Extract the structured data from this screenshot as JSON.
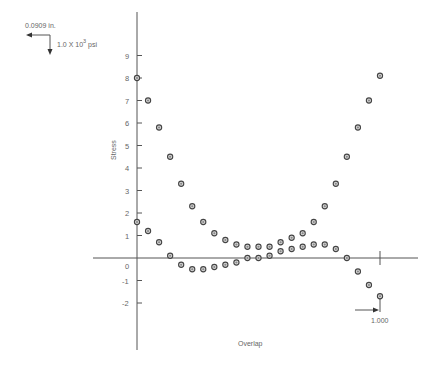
{
  "chart_data": {
    "type": "scatter",
    "title": "",
    "xlabel": "Overlap",
    "ylabel": "Stress",
    "y_tick_labels": [
      "9",
      "8",
      "7",
      "6",
      "5",
      "4",
      "3",
      "2",
      "1",
      "0",
      "-1",
      "-2"
    ],
    "y_ticks": [
      9,
      8,
      7,
      6,
      5,
      4,
      3,
      2,
      1,
      0,
      -1,
      -2
    ],
    "x_marker_label": "1.000",
    "x_marker_value": 1.0,
    "ylim": [
      -4.2,
      10.4
    ],
    "xlim": [
      -0.2,
      1.17
    ],
    "grid": false,
    "legend": null,
    "scale_indicator": {
      "horizontal_label": "0.0909 in.",
      "vertical_label_base": "1.0 X 10",
      "vertical_label_exp": "3",
      "vertical_label_unit": " psi"
    },
    "series": [
      {
        "name": "upper-curve",
        "x": [
          0.0,
          0.0455,
          0.0909,
          0.1364,
          0.1818,
          0.2273,
          0.2727,
          0.3182,
          0.3636,
          0.4091,
          0.4545,
          0.5,
          0.5455,
          0.5909,
          0.6364,
          0.6818,
          0.7273,
          0.7727,
          0.8182,
          0.8636,
          0.9091,
          0.9545,
          1.0
        ],
        "y": [
          8.0,
          7.0,
          5.8,
          4.5,
          3.3,
          2.3,
          1.6,
          1.1,
          0.8,
          0.6,
          0.5,
          0.5,
          0.5,
          0.7,
          0.9,
          1.1,
          1.6,
          2.3,
          3.3,
          4.5,
          5.8,
          7.0,
          8.1
        ]
      },
      {
        "name": "lower-curve",
        "x": [
          0.0,
          0.0455,
          0.0909,
          0.1364,
          0.1818,
          0.2273,
          0.2727,
          0.3182,
          0.3636,
          0.4091,
          0.4545,
          0.5,
          0.5455,
          0.5909,
          0.6364,
          0.6818,
          0.7273,
          0.7727,
          0.8182,
          0.8636,
          0.9091,
          0.9545,
          1.0
        ],
        "y": [
          1.6,
          1.2,
          0.7,
          0.1,
          -0.3,
          -0.5,
          -0.5,
          -0.4,
          -0.3,
          -0.2,
          0.0,
          0.0,
          0.1,
          0.3,
          0.4,
          0.5,
          0.6,
          0.6,
          0.4,
          0.0,
          -0.6,
          -1.2,
          -1.7
        ]
      }
    ]
  },
  "layout": {
    "x0_px": 137,
    "x1_px": 380,
    "y0_px": 258,
    "px_per_unit_y": 22.5
  }
}
